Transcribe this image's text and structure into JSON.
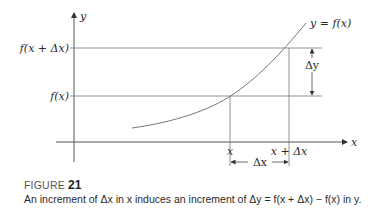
{
  "diagram": {
    "y_axis_label": "y",
    "x_axis_label": "x",
    "curve_label": "y = f(x)",
    "tick_labels_y": [
      "f(x + Δx)",
      "f(x)"
    ],
    "tick_labels_x": [
      "x",
      "x + Δx"
    ],
    "dimension_labels": {
      "delta_y": "Δy",
      "delta_x": "Δx"
    }
  },
  "caption": {
    "figure_word": "FIGURE",
    "figure_number": "21",
    "text": "An increment of Δx in x induces an increment of Δy = f(x + Δx) − f(x) in y."
  }
}
